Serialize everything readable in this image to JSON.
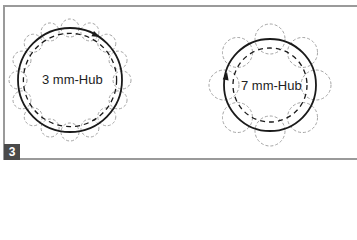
{
  "figure": {
    "number": "3",
    "panels": [
      {
        "label": "3 mm-Hub",
        "cx": 70,
        "cy": 80,
        "r": 52,
        "loops": 16,
        "loop_r": 9
      },
      {
        "label": "7 mm-Hub",
        "cx": 270,
        "cy": 85,
        "r": 46,
        "loops": 8,
        "loop_r": 15
      }
    ]
  },
  "colors": {
    "frame": "#9a9a9a",
    "main_circle": "#1a1a1a",
    "loop": "#9a9a9a",
    "badge_bg": "#4a4a4a"
  }
}
